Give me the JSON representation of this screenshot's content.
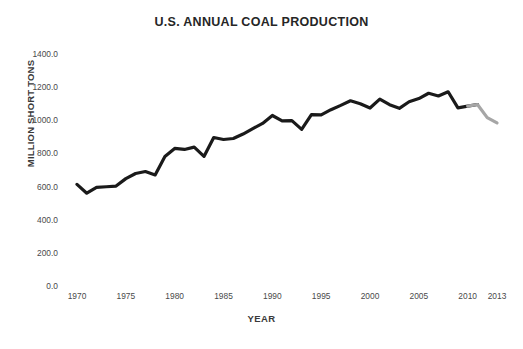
{
  "chart_data": {
    "type": "line",
    "title": "U.S. ANNUAL COAL PRODUCTION",
    "xlabel": "YEAR",
    "ylabel": "MILLION SHORT TONS",
    "grid": false,
    "legend": "none",
    "xlim": [
      1970,
      2013
    ],
    "ylim": [
      0,
      1400
    ],
    "yticks": [
      "0.0",
      "200.0",
      "400.0",
      "600.0",
      "800.0",
      "1000.0",
      "1200.0",
      "1400.0"
    ],
    "ytick_values": [
      0,
      200,
      400,
      600,
      800,
      1000,
      1200,
      1400
    ],
    "xticks": [
      "1970",
      "1975",
      "1980",
      "1985",
      "1990",
      "1995",
      "2000",
      "2005",
      "2010",
      "2013"
    ],
    "xtick_values": [
      1970,
      1975,
      1980,
      1985,
      1990,
      1995,
      2000,
      2005,
      2010,
      2013
    ],
    "x": [
      1970,
      1971,
      1972,
      1973,
      1974,
      1975,
      1976,
      1977,
      1978,
      1979,
      1980,
      1981,
      1982,
      1983,
      1984,
      1985,
      1986,
      1987,
      1988,
      1989,
      1990,
      1991,
      1992,
      1993,
      1994,
      1995,
      1996,
      1997,
      1998,
      1999,
      2000,
      2001,
      2002,
      2003,
      2004,
      2005,
      2006,
      2007,
      2008,
      2009,
      2010,
      2011,
      2012,
      2013
    ],
    "series": [
      {
        "name": "Historical production",
        "color": "#1a1a1a",
        "values": [
          613,
          560,
          595,
          599,
          603,
          648,
          679,
          691,
          670,
          781,
          830,
          824,
          838,
          782,
          896,
          884,
          890,
          917,
          950,
          981,
          1029,
          996,
          998,
          945,
          1034,
          1033,
          1064,
          1090,
          1118,
          1100,
          1074,
          1128,
          1094,
          1072,
          1112,
          1131,
          1163,
          1147,
          1172,
          1075,
          1085,
          1095,
          null,
          null
        ]
      },
      {
        "name": "Recent/estimated production",
        "color": "#a6a6a6",
        "values": [
          null,
          null,
          null,
          null,
          null,
          null,
          null,
          null,
          null,
          null,
          null,
          null,
          null,
          null,
          null,
          null,
          null,
          null,
          null,
          null,
          null,
          null,
          null,
          null,
          null,
          null,
          null,
          null,
          null,
          null,
          null,
          null,
          null,
          null,
          null,
          null,
          null,
          null,
          null,
          null,
          1085,
          1095,
          1016,
          984
        ]
      }
    ]
  }
}
